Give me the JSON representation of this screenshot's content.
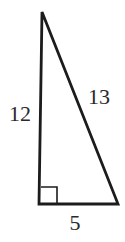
{
  "figure": {
    "type": "geometry-diagram",
    "shape": "right-triangle",
    "labels": {
      "left_side": "12",
      "hypotenuse": "13",
      "bottom_side": "5"
    },
    "right_angle_marker": true,
    "colors": {
      "line": "#1c1c1c",
      "text": "#2a2a2a",
      "background": "#ffffff"
    }
  }
}
